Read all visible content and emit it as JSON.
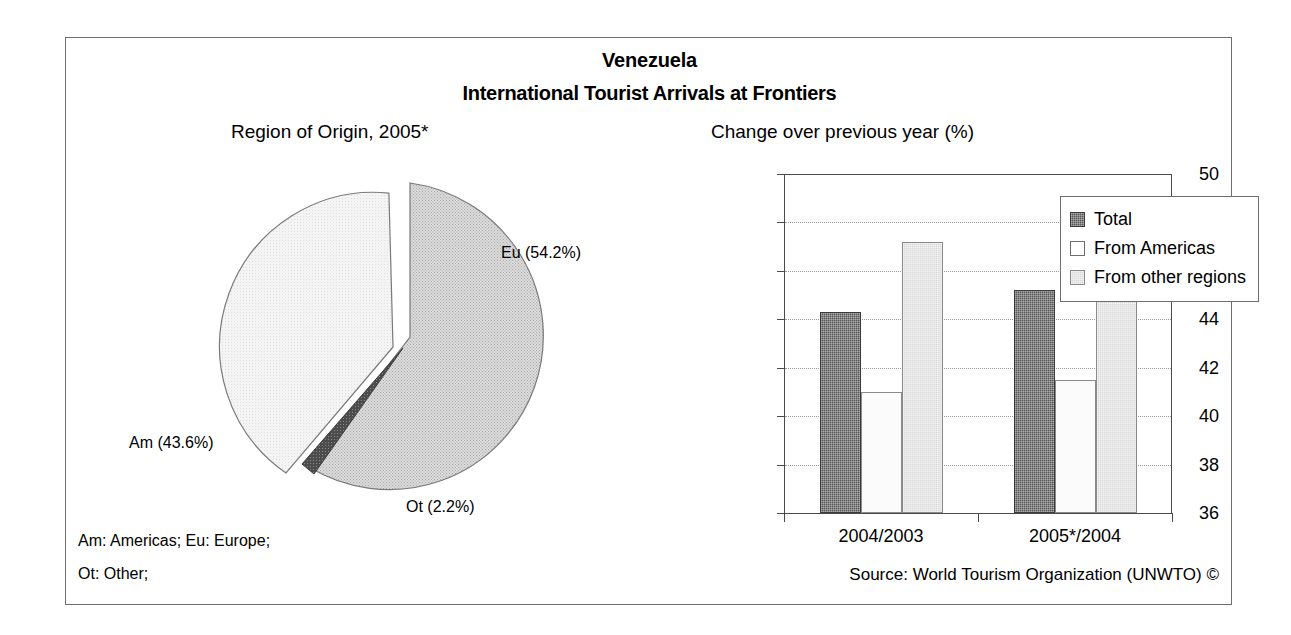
{
  "header": {
    "title": "Venezuela",
    "subtitle": "International Tourist Arrivals at Frontiers"
  },
  "panels": {
    "pie_title": "Region of Origin, 2005*",
    "bar_title": "Change over previous year (%)"
  },
  "footnotes": {
    "line1": "Am: Americas; Eu: Europe;",
    "line2": "Ot: Other;",
    "source": "Source: World Tourism Organization (UNWTO) ©"
  },
  "chart_data": [
    {
      "type": "pie",
      "title": "Region of Origin, 2005*",
      "unit": "%",
      "exploded": true,
      "labels": [
        "Eu",
        "Am",
        "Ot"
      ],
      "slice_labels": [
        "Eu (54.2%)",
        "Am (43.6%)",
        "Ot (2.2%)"
      ],
      "values": [
        54.2,
        43.6,
        2.2
      ],
      "colors": [
        "#d2d2d2",
        "#f2f2f2",
        "#4a4a4a"
      ],
      "legend_expansion": {
        "Am": "Americas",
        "Eu": "Europe",
        "Ot": "Other"
      }
    },
    {
      "type": "bar",
      "title": "Change over previous year (%)",
      "xlabel": "",
      "ylabel": "",
      "ylim": [
        36,
        50
      ],
      "ytick_step": 2,
      "yticks": [
        36,
        38,
        40,
        42,
        44,
        46,
        48,
        50
      ],
      "grid": true,
      "legend_position": "top-right",
      "categories": [
        "2004/2003",
        "2005*/2004"
      ],
      "series": [
        {
          "name": "Total",
          "values": [
            44.3,
            45.2
          ],
          "color": "#585858"
        },
        {
          "name": "From Americas",
          "values": [
            41.0,
            41.5
          ],
          "color": "#fbfbfb"
        },
        {
          "name": "From other regions",
          "values": [
            47.2,
            48.1
          ],
          "color": "#d7d7d7"
        }
      ]
    }
  ]
}
